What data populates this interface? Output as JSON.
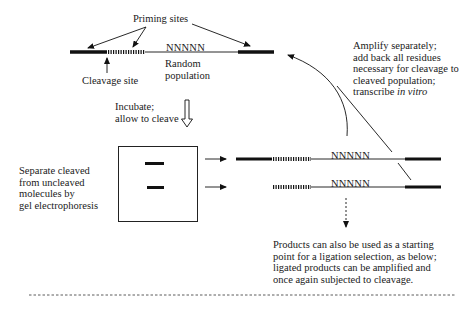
{
  "figure": {
    "top_molecule": {
      "priming_sites_label": "Priming sites",
      "cleavage_site_label": "Cleavage site",
      "random_region_label": "NNNNN",
      "random_population_label": [
        "Random",
        "population"
      ]
    },
    "incubate_step": {
      "label": [
        "Incubate;",
        "allow to cleave"
      ]
    },
    "gel_step": {
      "label": [
        "Separate cleaved",
        "from uncleaved",
        "molecules by",
        "gel electrophoresis"
      ],
      "band_count": 2
    },
    "amplify_step": {
      "label_lines": [
        {
          "text": "Amplify separately;"
        },
        {
          "text": "add back all residues"
        },
        {
          "text": "necessary for cleavage to"
        },
        {
          "text": "cleaved population;"
        },
        {
          "prefix": "transcribe ",
          "italic": "in vitro"
        }
      ]
    },
    "products": {
      "uncleaved_random_label": "NNNNN",
      "cleaved_random_label": "NNNNN",
      "note": [
        "Products can also be used as a starting",
        "point for a ligation selection, as below;",
        "ligated products can be amplified and",
        "once again subjected to cleavage."
      ]
    },
    "colors": {
      "line": "#111111",
      "background": "#ffffff"
    }
  }
}
